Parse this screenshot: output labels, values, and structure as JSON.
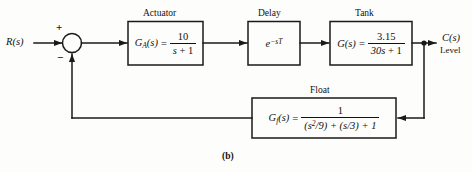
{
  "figure": {
    "caption": "(b)",
    "input_signal": "R(s)",
    "output_signal": "C(s)",
    "output_sublabel": "Level",
    "summing_junction": {
      "positive_sign": "+",
      "negative_sign": "−"
    },
    "line_color": "#1a1a1a",
    "background_color": "#fdfdfb"
  },
  "blocks": [
    {
      "id": "actuator",
      "title": "Actuator",
      "lhs": "G",
      "lhs_sub": "A",
      "lhs_arg": "(s)",
      "equals": "=",
      "numerator": "10",
      "denominator_pre": "s",
      "denominator_post": " + 1"
    },
    {
      "id": "delay",
      "title": "Delay",
      "expression_base": "e",
      "expression_exponent": "−sT"
    },
    {
      "id": "tank",
      "title": "Tank",
      "lhs": "G",
      "lhs_sub": "",
      "lhs_arg": "(s)",
      "equals": "=",
      "numerator": "3.15",
      "denominator_pre": "30s",
      "denominator_post": " + 1"
    },
    {
      "id": "float",
      "title": "Float",
      "lhs": "G",
      "lhs_sub": "f",
      "lhs_arg": "(s)",
      "equals": "=",
      "numerator": "1",
      "denominator": "(s2/9) + (s/3) + 1",
      "denominator_parts": {
        "p1": "(s",
        "p1_sup": "2",
        "p2": "/9) + (s/3) + 1"
      }
    }
  ]
}
